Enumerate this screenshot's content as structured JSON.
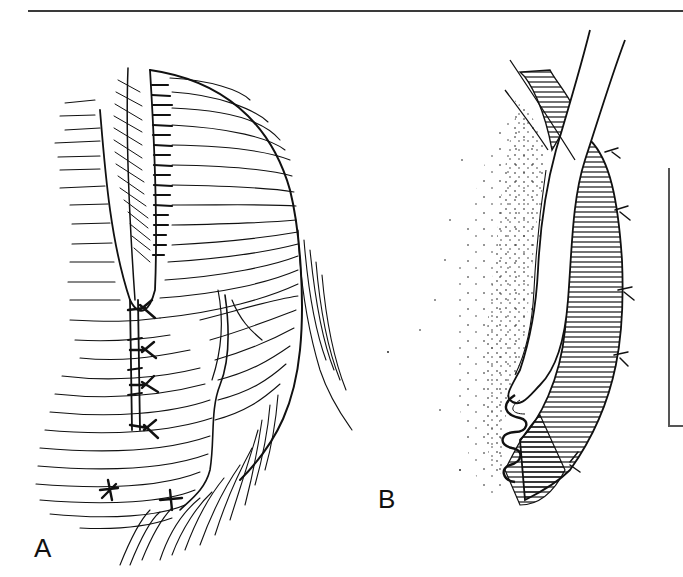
{
  "figure": {
    "type": "surgical-illustration",
    "style": "black-and-white line drawing",
    "panels": [
      {
        "id": "A",
        "label": "A",
        "description": "Sutured tissue flap with stitch line, muscle fiber hatching and vessel"
      },
      {
        "id": "B",
        "label": "B",
        "description": "Cross-section with tubular structure, hatched muscle layers and stippled tissue"
      }
    ],
    "scale_bar": {
      "orientation": "vertical",
      "label": ""
    }
  },
  "colors": {
    "ink": "#111111",
    "rule": "#3a3a3a",
    "scale": "#555555",
    "background": "#ffffff"
  }
}
